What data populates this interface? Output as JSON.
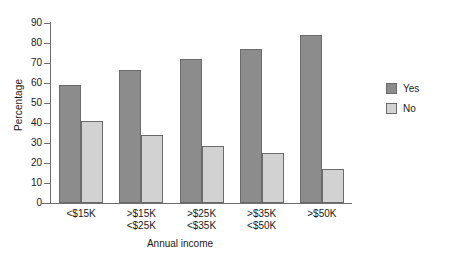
{
  "chart_data": {
    "type": "bar",
    "title": "",
    "subtitle": "",
    "xlabel": "Annual income",
    "ylabel": "Percentage",
    "categories": [
      "<$15K",
      ">$15K\n<$25K",
      ">$25K\n<$35K",
      ">$35K\n<$50K",
      ">$50K"
    ],
    "series": [
      {
        "name": "Yes",
        "color": "#8c8c8c",
        "values": [
          59,
          66.5,
          72,
          77,
          84
        ]
      },
      {
        "name": "No",
        "color": "#d2d2d2",
        "values": [
          41,
          34,
          28.5,
          25,
          17
        ]
      }
    ],
    "ylim": [
      0,
      90
    ],
    "ytick_values": [
      0,
      10,
      20,
      30,
      40,
      50,
      60,
      70,
      80,
      90
    ],
    "ytick_labels": [
      "0",
      "10",
      "20",
      "30",
      "40",
      "50",
      "60",
      "70",
      "80",
      "90"
    ],
    "grid": false,
    "legend_position": "right",
    "axis_color": "#6e6e6e",
    "bar_edge_color": "#6b6b6b",
    "background": "#ffffff"
  },
  "legend": {
    "entries": [
      {
        "label": "Yes"
      },
      {
        "label": "No"
      }
    ]
  }
}
